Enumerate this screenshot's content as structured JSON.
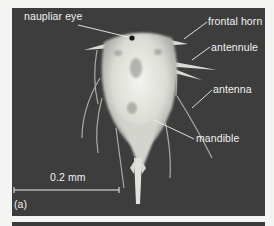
{
  "figure": {
    "panel_label": "(a)",
    "scale_bar": {
      "label": "0.2 mm"
    },
    "annotations": [
      {
        "id": "naupliar-eye",
        "label": "naupliar eye"
      },
      {
        "id": "frontal-horn",
        "label": "frontal horn"
      },
      {
        "id": "antennule",
        "label": "antennule"
      },
      {
        "id": "antenna",
        "label": "antenna"
      },
      {
        "id": "mandible",
        "label": "mandible"
      }
    ],
    "colors": {
      "background": "#3c3c3c",
      "specimen": "#e6e6e2",
      "text": "#f2f2f2",
      "page": "#f4f4f2"
    }
  }
}
